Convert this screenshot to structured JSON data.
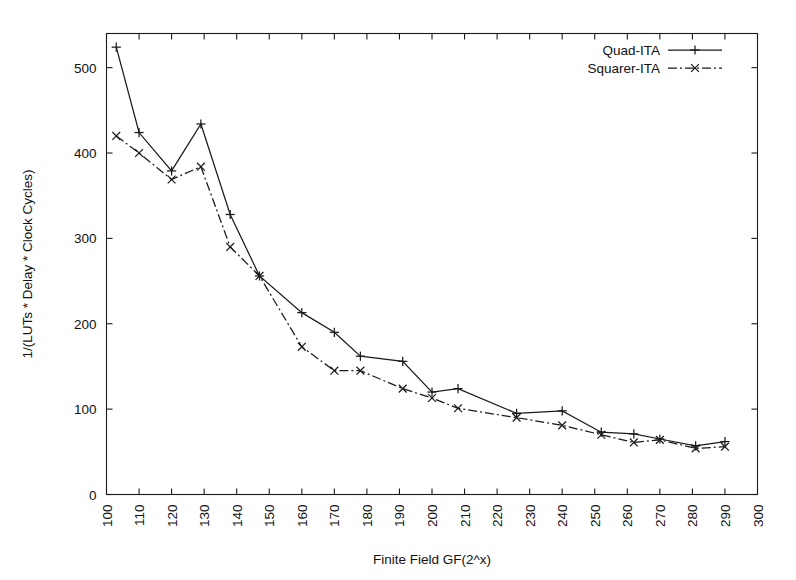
{
  "chart_data": {
    "type": "line",
    "title": "",
    "subtitle": "",
    "xlabel": "Finite Field GF(2^x)",
    "ylabel": "1/(LUTs * Delay * Clock Cycles)",
    "xlim": [
      100,
      300
    ],
    "ylim": [
      0,
      540
    ],
    "xticks": [
      100,
      110,
      120,
      130,
      140,
      150,
      160,
      170,
      180,
      190,
      200,
      210,
      220,
      230,
      240,
      250,
      260,
      270,
      280,
      290,
      300
    ],
    "yticks": [
      0,
      100,
      200,
      300,
      400,
      500
    ],
    "xtick_labels": [
      "100",
      "110",
      "120",
      "130",
      "140",
      "150",
      "160",
      "170",
      "180",
      "190",
      "200",
      "210",
      "220",
      "230",
      "240",
      "250",
      "260",
      "270",
      "280",
      "290",
      "300"
    ],
    "ytick_labels": [
      "0",
      "100",
      "200",
      "300",
      "400",
      "500"
    ],
    "xtick_label_rotation": -90,
    "grid": false,
    "legend_position": "top-right",
    "series": [
      {
        "name": "Quad-ITA",
        "marker": "plus",
        "linestyle": "solid",
        "color": "#1a1a1a",
        "x": [
          103,
          110,
          120,
          129,
          138,
          147,
          160,
          170,
          178,
          191,
          200,
          208,
          226,
          240,
          252,
          262,
          270,
          281,
          290
        ],
        "values": [
          524,
          424,
          379,
          434,
          328,
          256,
          213,
          190,
          162,
          156,
          120,
          124,
          95,
          98,
          73,
          71,
          65,
          57,
          62
        ]
      },
      {
        "name": "Squarer-ITA",
        "marker": "x",
        "linestyle": "dashdot",
        "color": "#1a1a1a",
        "x": [
          103,
          110,
          120,
          129,
          138,
          147,
          160,
          170,
          178,
          191,
          200,
          208,
          226,
          240,
          252,
          262,
          270,
          281,
          290
        ],
        "values": [
          420,
          400,
          369,
          384,
          290,
          256,
          173,
          145,
          145,
          124,
          113,
          101,
          90,
          81,
          70,
          61,
          64,
          54,
          56
        ]
      }
    ],
    "annotations": []
  },
  "legend": {
    "entries": [
      {
        "label": "Quad-ITA",
        "style": "solid-plus"
      },
      {
        "label": "Squarer-ITA",
        "style": "dashdot-x"
      }
    ]
  },
  "axes": {
    "x_axis_label": "Finite Field GF(2^x)",
    "y_axis_label": "1/(LUTs * Delay * Clock Cycles)"
  }
}
